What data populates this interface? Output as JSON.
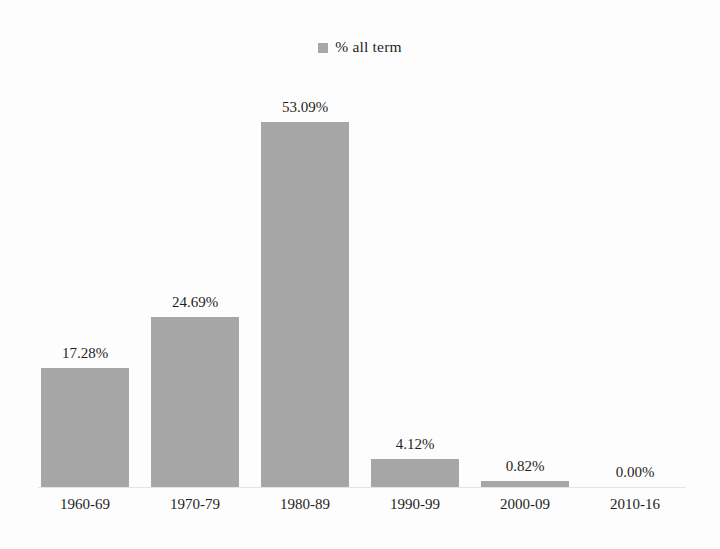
{
  "chart_data": {
    "type": "bar",
    "title": "",
    "subtitle": "",
    "xlabel": "",
    "ylabel": "",
    "categories": [
      "1960-69",
      "1970-79",
      "1980-89",
      "1990-99",
      "2000-09",
      "2010-16"
    ],
    "values": [
      17.28,
      24.69,
      53.09,
      4.12,
      0.82,
      0.0
    ],
    "value_labels": [
      "17.28%",
      "24.69%",
      "53.09%",
      "4.12%",
      "0.82%",
      "0.00%"
    ],
    "series": [
      {
        "name": "% all term",
        "values": [
          17.28,
          24.69,
          53.09,
          4.12,
          0.82,
          0.0
        ],
        "color": "#a6a6a6"
      }
    ],
    "ylim": [
      0,
      58
    ],
    "grid": false,
    "legend": {
      "position": "top-center",
      "entries": [
        {
          "label": "% all term",
          "color": "#a6a6a6",
          "marker": "square"
        }
      ]
    },
    "axis": {
      "x_tick_labels": [
        "1960-69",
        "1970-79",
        "1980-89",
        "1990-99",
        "2000-09",
        "2010-16"
      ],
      "y_tick_labels": [],
      "baseline_color": "#e4e4e4"
    },
    "colors": {
      "bar_fill": "#a6a6a6",
      "background": "#fdfdfd",
      "text": "#1f1f1f"
    }
  }
}
